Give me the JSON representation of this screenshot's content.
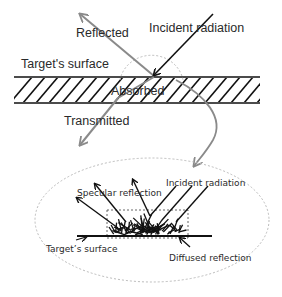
{
  "diagram": {
    "top_panel": {
      "labels": {
        "reflected": "Reflected",
        "incident": "Incident radiation",
        "surface": "Target's surface",
        "absorbed": "Absorbed",
        "transmitted": "Transmitted"
      }
    },
    "bottom_panel": {
      "labels": {
        "specular": "Specular reflection",
        "incident": "Incident radiation",
        "surface": "Target’s surface",
        "diffused": "Diffused reflection"
      }
    },
    "colors": {
      "ink": "#111111",
      "gray_arrow": "#8a8a8a",
      "dashed": "#bbbbbb",
      "text": "#2a2a2a"
    }
  }
}
